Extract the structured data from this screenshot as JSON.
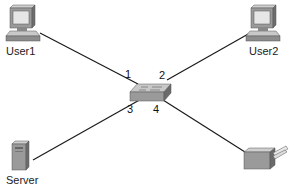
{
  "diagram": {
    "type": "network-topology",
    "central_device": {
      "name": "switch",
      "ports": [
        "1",
        "2",
        "3",
        "4"
      ]
    },
    "nodes": [
      {
        "id": "user1",
        "label": "User1",
        "device": "pc",
        "port": "1"
      },
      {
        "id": "user2",
        "label": "User2",
        "device": "pc",
        "port": "2"
      },
      {
        "id": "server",
        "label": "Server",
        "device": "server",
        "port": "3"
      },
      {
        "id": "printer",
        "label": "",
        "device": "printer",
        "port": "4"
      }
    ],
    "ports": {
      "p1": "1",
      "p2": "2",
      "p3": "3",
      "p4": "4"
    },
    "colors": {
      "line": "#1a1a1a",
      "device_face": "#9a9a9a",
      "device_top": "#c8c8c8",
      "device_side": "#6e6e6e"
    }
  }
}
